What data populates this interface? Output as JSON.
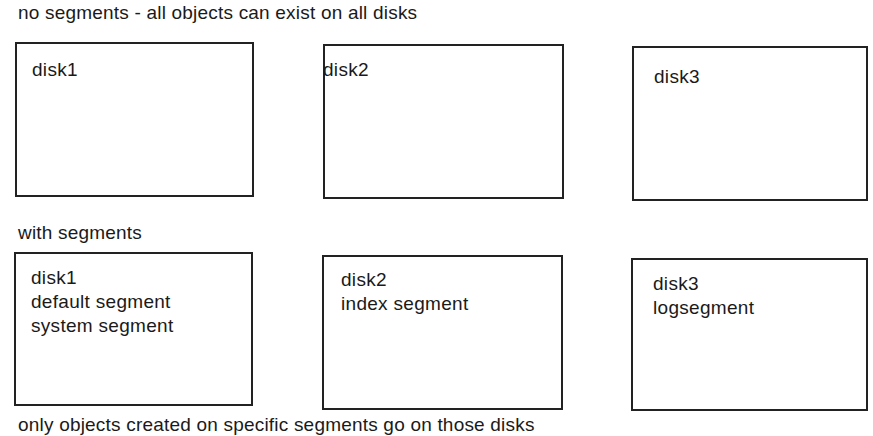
{
  "section_no_segments": {
    "caption": "no segments - all objects can exist on all disks",
    "disks": [
      {
        "lines": [
          "disk1"
        ]
      },
      {
        "lines": [
          "disk2"
        ]
      },
      {
        "lines": [
          "disk3"
        ]
      }
    ]
  },
  "section_with_segments": {
    "caption": "with segments",
    "disks": [
      {
        "lines": [
          "disk1",
          "default segment",
          "system segment"
        ]
      },
      {
        "lines": [
          "disk2",
          "index segment"
        ]
      },
      {
        "lines": [
          "disk3",
          "logsegment"
        ]
      }
    ]
  },
  "footer": {
    "caption": "only objects created on specific segments go on those disks"
  },
  "colors": {
    "border": "#222222",
    "text": "#1a1a1a",
    "background": "#ffffff"
  }
}
